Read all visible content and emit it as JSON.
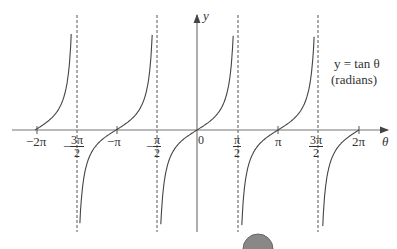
{
  "chart_data": {
    "type": "line",
    "function": "tan",
    "xlabel": "θ",
    "ylabel": "y",
    "annotation": [
      "y = tan θ",
      "(radians)"
    ],
    "x_tick_labels": [
      "−2π",
      "−3π/2",
      "−π",
      "−π/2",
      "0",
      "π/2",
      "π",
      "3π/2",
      "2π"
    ],
    "x_tick_values": [
      -6.2832,
      -4.7124,
      -3.1416,
      -1.5708,
      0,
      1.5708,
      3.1416,
      4.7124,
      6.2832
    ],
    "asymptotes": [
      "−3π/2",
      "−π/2",
      "π/2",
      "3π/2"
    ],
    "xlim": [
      -7.2,
      7.4
    ],
    "ylim": [
      -6,
      6
    ],
    "grid": false,
    "legend": "none",
    "series": [
      {
        "name": "tan θ",
        "x_range": [
          -6.2832,
          -4.75
        ],
        "note": "branch from −2π approaching +∞ at −3π/2"
      },
      {
        "name": "tan θ",
        "x_range": [
          -4.67,
          -1.61
        ],
        "note": "branch from −∞ at −3π/2 to +∞ at −π/2"
      },
      {
        "name": "tan θ",
        "x_range": [
          -1.53,
          1.53
        ],
        "note": "principal branch through origin"
      },
      {
        "name": "tan θ",
        "x_range": [
          1.61,
          4.67
        ],
        "note": "branch from −∞ at π/2 to +∞ at 3π/2"
      },
      {
        "name": "tan θ",
        "x_range": [
          4.75,
          6.2832
        ],
        "note": "branch from −∞ at 3π/2 to 2π"
      }
    ]
  },
  "labels": {
    "y_axis": "y",
    "x_axis": "θ",
    "eq_line1": "y = tan θ",
    "eq_line2": "(radians)",
    "origin": "0",
    "neg2pi": "−2π",
    "negpi": "−π",
    "pi": "π",
    "pos2pi": "2π",
    "neg3pi2_num": "3π",
    "negpi2_num": "π",
    "pi2_num": "π",
    "pos3pi2_num": "3π",
    "two": "2",
    "minus": "−"
  }
}
